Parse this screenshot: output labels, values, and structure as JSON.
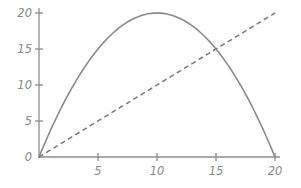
{
  "chart_data": {
    "type": "line",
    "title": "",
    "xlabel": "",
    "ylabel": "",
    "xlim": [
      0,
      20
    ],
    "ylim": [
      0,
      20
    ],
    "x_ticks": [
      5,
      10,
      15,
      20
    ],
    "y_ticks": [
      0,
      5,
      10,
      15,
      20
    ],
    "x_tick_labels": [
      "5",
      "10",
      "15",
      "20"
    ],
    "y_tick_labels": [
      "0",
      "5",
      "10",
      "15",
      "20"
    ],
    "grid": false,
    "legend": null,
    "series": [
      {
        "name": "curve",
        "style": "solid",
        "color": "#8a8a8a",
        "x": [
          0,
          2,
          4,
          6,
          8,
          10,
          12,
          14,
          15,
          16,
          18,
          20
        ],
        "y": [
          0,
          7.2,
          12.8,
          16.8,
          19.2,
          20,
          19.2,
          16.8,
          15,
          12.8,
          7.2,
          0
        ]
      },
      {
        "name": "line",
        "style": "dashed",
        "color": "#7a7a7a",
        "x": [
          0,
          20
        ],
        "y": [
          0,
          20
        ]
      }
    ],
    "annotations": [
      "curves intersect at (15, 15)"
    ]
  },
  "layout": {
    "origin_px": [
      39,
      157
    ],
    "x_px_per_unit": 11.8,
    "y_px_per_unit": 7.2
  }
}
